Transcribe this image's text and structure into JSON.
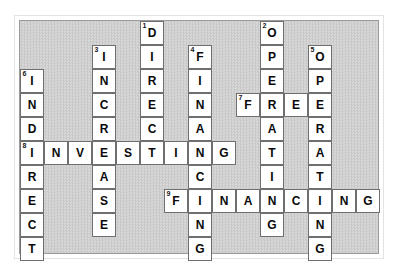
{
  "puzzle": {
    "title": "Financial Statement Crossword",
    "grid": {
      "columns": 16,
      "rows": 10,
      "cell_size_px": 24,
      "origin_x_px": 19,
      "origin_y_px": 20,
      "background_color": "#d0d0d0",
      "cell_fill_color": "#ffffff",
      "cell_border_color": "#6f6f6f",
      "letter_color": "#0a0a0a",
      "number_color": "#151515"
    },
    "entries": [
      {
        "number": "1",
        "direction": "down",
        "answer": "DIRECT",
        "row": 0,
        "col": 5,
        "length": 6
      },
      {
        "number": "2",
        "direction": "down",
        "answer": "OPERATING",
        "row": 0,
        "col": 10,
        "length": 9
      },
      {
        "number": "3",
        "direction": "down",
        "answer": "INCREASE",
        "row": 1,
        "col": 3,
        "length": 8
      },
      {
        "number": "4",
        "direction": "down",
        "answer": "FINANCING",
        "row": 1,
        "col": 7,
        "length": 9
      },
      {
        "number": "5",
        "direction": "down",
        "answer": "OPERATING",
        "row": 1,
        "col": 12,
        "length": 9
      },
      {
        "number": "6",
        "direction": "down",
        "answer": "INDIRECT",
        "row": 2,
        "col": 0,
        "length": 8
      },
      {
        "number": "7",
        "direction": "across",
        "answer": "FREE",
        "row": 4,
        "col": 9,
        "length": 4
      },
      {
        "number": "8",
        "direction": "across",
        "answer": "INVESTING",
        "row": 6,
        "col": 0,
        "length": 9
      },
      {
        "number": "9",
        "direction": "across",
        "answer": "FINANCING",
        "row": 8,
        "col": 6,
        "length": 9
      }
    ],
    "cells": [
      {
        "row": 0,
        "col": 5,
        "letter": "D",
        "number": "1"
      },
      {
        "row": 0,
        "col": 10,
        "letter": "O",
        "number": "2"
      },
      {
        "row": 1,
        "col": 3,
        "letter": "I",
        "number": "3"
      },
      {
        "row": 1,
        "col": 5,
        "letter": "I",
        "number": ""
      },
      {
        "row": 1,
        "col": 7,
        "letter": "F",
        "number": "4"
      },
      {
        "row": 1,
        "col": 10,
        "letter": "P",
        "number": ""
      },
      {
        "row": 1,
        "col": 12,
        "letter": "O",
        "number": "5"
      },
      {
        "row": 2,
        "col": 0,
        "letter": "I",
        "number": "6"
      },
      {
        "row": 2,
        "col": 3,
        "letter": "N",
        "number": ""
      },
      {
        "row": 2,
        "col": 5,
        "letter": "R",
        "number": ""
      },
      {
        "row": 2,
        "col": 7,
        "letter": "I",
        "number": ""
      },
      {
        "row": 2,
        "col": 10,
        "letter": "E",
        "number": ""
      },
      {
        "row": 2,
        "col": 12,
        "letter": "P",
        "number": ""
      },
      {
        "row": 3,
        "col": 0,
        "letter": "N",
        "number": ""
      },
      {
        "row": 3,
        "col": 3,
        "letter": "C",
        "number": ""
      },
      {
        "row": 3,
        "col": 5,
        "letter": "E",
        "number": ""
      },
      {
        "row": 3,
        "col": 7,
        "letter": "N",
        "number": ""
      },
      {
        "row": 3,
        "col": 9,
        "letter": "F",
        "number": "7"
      },
      {
        "row": 3,
        "col": 10,
        "letter": "R",
        "number": ""
      },
      {
        "row": 3,
        "col": 11,
        "letter": "E",
        "number": ""
      },
      {
        "row": 3,
        "col": 12,
        "letter": "E",
        "number": ""
      },
      {
        "row": 4,
        "col": 0,
        "letter": "D",
        "number": ""
      },
      {
        "row": 4,
        "col": 3,
        "letter": "R",
        "number": ""
      },
      {
        "row": 4,
        "col": 5,
        "letter": "C",
        "number": ""
      },
      {
        "row": 4,
        "col": 7,
        "letter": "A",
        "number": ""
      },
      {
        "row": 4,
        "col": 10,
        "letter": "A",
        "number": ""
      },
      {
        "row": 4,
        "col": 12,
        "letter": "R",
        "number": ""
      },
      {
        "row": 5,
        "col": 0,
        "letter": "I",
        "number": "8"
      },
      {
        "row": 5,
        "col": 1,
        "letter": "N",
        "number": ""
      },
      {
        "row": 5,
        "col": 2,
        "letter": "V",
        "number": ""
      },
      {
        "row": 5,
        "col": 3,
        "letter": "E",
        "number": ""
      },
      {
        "row": 5,
        "col": 4,
        "letter": "S",
        "number": ""
      },
      {
        "row": 5,
        "col": 5,
        "letter": "T",
        "number": ""
      },
      {
        "row": 5,
        "col": 6,
        "letter": "I",
        "number": ""
      },
      {
        "row": 5,
        "col": 7,
        "letter": "N",
        "number": ""
      },
      {
        "row": 5,
        "col": 8,
        "letter": "G",
        "number": ""
      },
      {
        "row": 5,
        "col": 10,
        "letter": "T",
        "number": ""
      },
      {
        "row": 5,
        "col": 12,
        "letter": "A",
        "number": ""
      },
      {
        "row": 6,
        "col": 0,
        "letter": "R",
        "number": ""
      },
      {
        "row": 6,
        "col": 3,
        "letter": "A",
        "number": ""
      },
      {
        "row": 6,
        "col": 7,
        "letter": "C",
        "number": ""
      },
      {
        "row": 6,
        "col": 10,
        "letter": "I",
        "number": ""
      },
      {
        "row": 6,
        "col": 12,
        "letter": "T",
        "number": ""
      },
      {
        "row": 7,
        "col": 0,
        "letter": "E",
        "number": ""
      },
      {
        "row": 7,
        "col": 3,
        "letter": "S",
        "number": ""
      },
      {
        "row": 7,
        "col": 6,
        "letter": "F",
        "number": "9"
      },
      {
        "row": 7,
        "col": 7,
        "letter": "I",
        "number": ""
      },
      {
        "row": 7,
        "col": 8,
        "letter": "N",
        "number": ""
      },
      {
        "row": 7,
        "col": 9,
        "letter": "A",
        "number": ""
      },
      {
        "row": 7,
        "col": 10,
        "letter": "N",
        "number": ""
      },
      {
        "row": 7,
        "col": 11,
        "letter": "C",
        "number": ""
      },
      {
        "row": 7,
        "col": 12,
        "letter": "I",
        "number": ""
      },
      {
        "row": 7,
        "col": 13,
        "letter": "N",
        "number": ""
      },
      {
        "row": 7,
        "col": 14,
        "letter": "G",
        "number": ""
      },
      {
        "row": 8,
        "col": 0,
        "letter": "C",
        "number": ""
      },
      {
        "row": 8,
        "col": 3,
        "letter": "E",
        "number": ""
      },
      {
        "row": 8,
        "col": 7,
        "letter": "N",
        "number": ""
      },
      {
        "row": 8,
        "col": 10,
        "letter": "G",
        "number": ""
      },
      {
        "row": 8,
        "col": 12,
        "letter": "N",
        "number": ""
      },
      {
        "row": 9,
        "col": 0,
        "letter": "T",
        "number": ""
      },
      {
        "row": 9,
        "col": 7,
        "letter": "G",
        "number": ""
      },
      {
        "row": 9,
        "col": 12,
        "letter": "G",
        "number": ""
      }
    ]
  }
}
